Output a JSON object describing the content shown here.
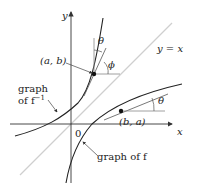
{
  "axes": {
    "x_label": "x",
    "y_label": "y",
    "origin_label": "0"
  },
  "lines": {
    "identity_label": "y = x"
  },
  "points": {
    "p1_label": "(a, b)",
    "p2_label": "(b, a)"
  },
  "angles": {
    "theta_top": "θ",
    "phi": "ϕ",
    "theta_right": "θ"
  },
  "curves": {
    "inverse_label_line1": "graph",
    "inverse_label_line2": "of f",
    "inverse_superscript": "−1",
    "f_label": "graph of f"
  },
  "colors": {
    "axis": "#333333",
    "curve": "#222222",
    "identity_line": "#c8c8c8",
    "helper": "#9a9a9a"
  }
}
